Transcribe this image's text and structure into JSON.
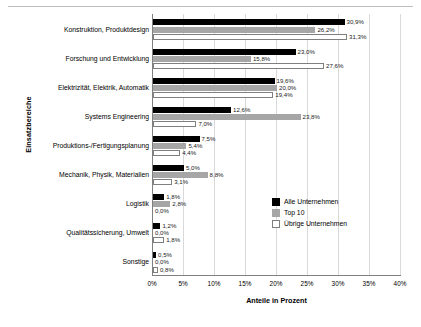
{
  "chart_data": {
    "type": "bar",
    "orientation": "horizontal",
    "title": "",
    "xlabel": "Anteile in Prozent",
    "ylabel": "Einsatzbereiche",
    "xlim": [
      0,
      40
    ],
    "xticks": [
      "0%",
      "5%",
      "10%",
      "15%",
      "20%",
      "25%",
      "30%",
      "35%",
      "40%"
    ],
    "xtick_values": [
      0,
      5,
      10,
      15,
      20,
      25,
      30,
      35,
      40
    ],
    "grid": true,
    "legend_position": "inside-right",
    "categories": [
      "Konstruktion, Produktdesign",
      "Forschung und Entwicklung",
      "Elektrizität, Elektrik, Automatik",
      "Systems Engineering",
      "Produktions-/Fertigungsplanung",
      "Mechanik, Physik, Materialien",
      "Logistik",
      "Qualitätssicherung, Umwelt",
      "Sonstige"
    ],
    "series": [
      {
        "name": "Alle Unternehmen",
        "color": "#000000",
        "values": [
          30.9,
          23.0,
          19.6,
          12.6,
          7.5,
          5.0,
          1.8,
          1.2,
          0.5
        ],
        "labels": [
          "30,9%",
          "23,0%",
          "19,6%",
          "12,6%",
          "7,5%",
          "5,0%",
          "1,8%",
          "1,2%",
          "0,5%"
        ]
      },
      {
        "name": "Top 10",
        "color": "#a6a6a6",
        "values": [
          26.2,
          15.8,
          20.0,
          23.8,
          5.4,
          8.8,
          2.8,
          0.0,
          0.0
        ],
        "labels": [
          "26,2%",
          "15,8%",
          "20,0%",
          "23,8%",
          "5,4%",
          "8,8%",
          "2,8%",
          "0,0%",
          "0,0%"
        ]
      },
      {
        "name": "Übrige Unternehmen",
        "color": "#ffffff",
        "values": [
          31.3,
          27.6,
          19.4,
          7.0,
          4.4,
          3.1,
          0.0,
          1.8,
          0.8
        ],
        "labels": [
          "31,3%",
          "27,6%",
          "19,4%",
          "7,0%",
          "4,4%",
          "3,1%",
          "0,0%",
          "1,8%",
          "0,8%"
        ]
      }
    ]
  },
  "legend": {
    "items": [
      {
        "label": "Alle Unternehmen"
      },
      {
        "label": "Top 10"
      },
      {
        "label": "Übrige Unternehmen"
      }
    ]
  }
}
